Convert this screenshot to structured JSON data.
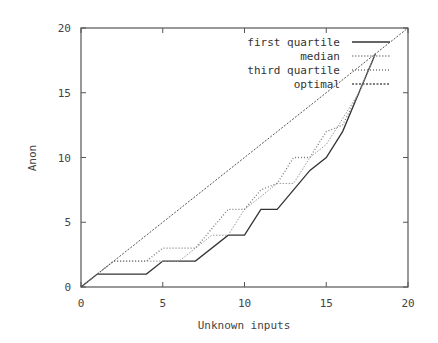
{
  "chart_data": {
    "type": "line",
    "title": "",
    "xlabel": "Unknown inputs",
    "ylabel": "Anon",
    "xlim": [
      0,
      20
    ],
    "ylim": [
      0,
      20
    ],
    "xticks": [
      0,
      5,
      10,
      15,
      20
    ],
    "yticks": [
      0,
      5,
      10,
      15,
      20
    ],
    "grid": false,
    "legend_position": "upper right",
    "series": [
      {
        "name": "first quartile",
        "style": "solid",
        "color": "#333333",
        "points": [
          [
            0,
            0
          ],
          [
            1,
            1
          ],
          [
            4,
            1
          ],
          [
            5,
            2
          ],
          [
            7,
            2
          ],
          [
            9,
            4
          ],
          [
            10,
            4
          ],
          [
            11,
            6
          ],
          [
            12,
            6
          ],
          [
            14,
            9
          ],
          [
            15,
            10
          ],
          [
            16,
            12
          ],
          [
            17,
            15
          ],
          [
            18,
            18
          ]
        ]
      },
      {
        "name": "median",
        "style": "light-dotted",
        "color": "#999999",
        "points": [
          [
            0,
            0
          ],
          [
            1,
            1
          ],
          [
            2,
            2
          ],
          [
            6,
            2
          ],
          [
            7,
            3
          ],
          [
            8,
            4
          ],
          [
            9,
            4
          ],
          [
            10,
            6
          ],
          [
            11,
            7
          ],
          [
            12,
            8
          ],
          [
            13,
            8
          ],
          [
            14,
            10
          ],
          [
            15,
            11
          ],
          [
            16,
            13
          ],
          [
            17,
            15
          ],
          [
            18,
            18
          ]
        ]
      },
      {
        "name": "third quartile",
        "style": "dotted",
        "color": "#777777",
        "points": [
          [
            0,
            0
          ],
          [
            2,
            2
          ],
          [
            4,
            2
          ],
          [
            5,
            3
          ],
          [
            7,
            3
          ],
          [
            9,
            6
          ],
          [
            10,
            6
          ],
          [
            11,
            7.5
          ],
          [
            12,
            8
          ],
          [
            13,
            10
          ],
          [
            14,
            10
          ],
          [
            15,
            12
          ],
          [
            16,
            12.5
          ],
          [
            17,
            15
          ],
          [
            18,
            18
          ]
        ]
      },
      {
        "name": "optimal",
        "style": "dash-dot",
        "color": "#555555",
        "points": [
          [
            0,
            0
          ],
          [
            20,
            20
          ]
        ]
      }
    ]
  },
  "axes": {
    "xlabel": "Unknown inputs",
    "ylabel": "Anon",
    "xtick_labels": [
      "0",
      "5",
      "10",
      "15",
      "20"
    ],
    "ytick_labels": [
      "0",
      "5",
      "10",
      "15",
      "20"
    ]
  },
  "legend": {
    "items": [
      {
        "label": "first quartile"
      },
      {
        "label": "median"
      },
      {
        "label": "third quartile"
      },
      {
        "label": "optimal"
      }
    ]
  }
}
